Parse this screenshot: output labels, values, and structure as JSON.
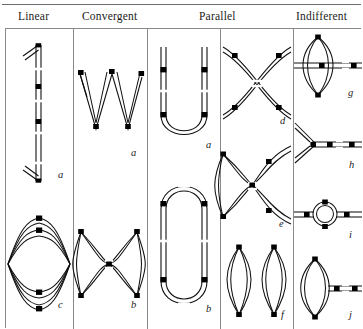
{
  "figure": {
    "columns": [
      {
        "id": "linear",
        "label": "Linear"
      },
      {
        "id": "convergent",
        "label": "Convergent"
      },
      {
        "id": "parallel",
        "label": "Parallel"
      },
      {
        "id": "indifferent",
        "label": "Indifferent"
      }
    ],
    "style": {
      "line_color": "#111111",
      "node_color": "#000000",
      "rule_color": "#6e6e6e",
      "grid_color": "#8a8a8a",
      "background": "#ffffff"
    },
    "panels": [
      {
        "id": "linear-a",
        "column": "linear",
        "caption": "a",
        "shape": "vertical-linear-chain",
        "description": "Straight vertical double-track with open arrowheads at top and bottom and two filled square nodes along its length",
        "node_count": 2,
        "arrowheads": 2
      },
      {
        "id": "linear-c",
        "column": "linear",
        "caption": "c",
        "shape": "lens-multiarc",
        "description": "Horizontal lens formed by multiple converging arcs meeting at four stacked filled nodes",
        "node_count": 4,
        "arrowheads": 0
      },
      {
        "id": "convergent-a",
        "column": "convergent",
        "caption": "a",
        "shape": "zigzag-w",
        "description": "W-shaped zigzag double-track with filled nodes at each apex and vertex",
        "node_count": 5,
        "arrowheads": 0
      },
      {
        "id": "convergent-b",
        "column": "convergent",
        "caption": "b",
        "shape": "figure-eight-lenses",
        "description": "Two horizontally adjacent lens loops meeting at a shared central crossing node",
        "node_count": 5,
        "arrowheads": 0
      },
      {
        "id": "parallel-a",
        "column": "parallel",
        "caption": "a",
        "shape": "u-hairpin",
        "description": "Open U-shaped hairpin of two parallel tracks with filled nodes on the upper limbs and at the bend",
        "node_count": 4,
        "arrowheads": 0
      },
      {
        "id": "parallel-b",
        "column": "parallel",
        "caption": "b",
        "shape": "stadium-loop",
        "description": "Closed stadium / racetrack loop of parallel tracks with four filled nodes on the straight sides",
        "node_count": 4,
        "arrowheads": 0
      },
      {
        "id": "parallel-d",
        "column": "parallel",
        "caption": "d",
        "shape": "x-crossing",
        "description": "X-shaped crossing of two curved double-tracks with filled nodes on all four arms",
        "node_count": 4,
        "arrowheads": 0
      },
      {
        "id": "parallel-e",
        "column": "parallel",
        "caption": "e",
        "shape": "figure-eight-open",
        "description": "Closed lens on the left joined at a central node to an open loop whose two limbs exit to the right",
        "node_count": 4,
        "arrowheads": 0
      },
      {
        "id": "parallel-f",
        "column": "parallel",
        "caption": "f",
        "shape": "twin-vertical-lenses",
        "description": "Two tall narrow vertical lens loops side by side, each closed at filled nodes top and bottom",
        "node_count": 4,
        "arrowheads": 0
      },
      {
        "id": "indifferent-g",
        "column": "indifferent",
        "caption": "g",
        "shape": "lens-with-through-line",
        "description": "Vertical lens pierced by a horizontal double-track that continues to the right edge",
        "node_count": 4,
        "arrowheads": 0
      },
      {
        "id": "indifferent-h",
        "column": "indifferent",
        "caption": "h",
        "shape": "y-branch",
        "description": "Y-shaped bifurcation opening to the left with a horizontal stem running to the right edge",
        "node_count": 3,
        "arrowheads": 0
      },
      {
        "id": "indifferent-i",
        "column": "indifferent",
        "caption": "i",
        "shape": "ring-on-line",
        "description": "Small circular ring inserted in a horizontal double-track that spans the panel",
        "node_count": 4,
        "arrowheads": 0
      },
      {
        "id": "indifferent-j",
        "column": "indifferent",
        "caption": "j",
        "shape": "lens-with-tail",
        "description": "Vertical lens loop on the left with a horizontal double-track tail running to the right edge",
        "node_count": 4,
        "arrowheads": 0
      }
    ]
  }
}
